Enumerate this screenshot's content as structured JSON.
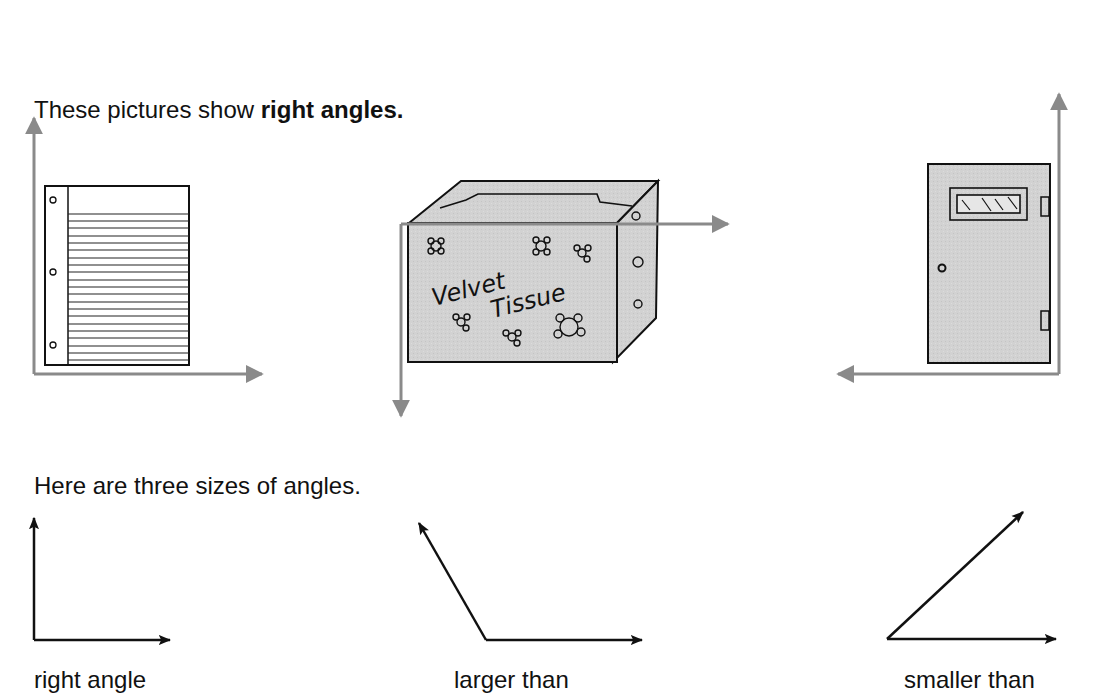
{
  "section1": {
    "intro": "These pictures show ",
    "intro_bold": "right angles.",
    "pictures": [
      {
        "name": "notebook-paper",
        "arrow_directions": [
          "up",
          "right"
        ]
      },
      {
        "name": "tissue-box",
        "label_line1": "Velvet",
        "label_line2": "Tissue",
        "arrow_directions": [
          "right",
          "down"
        ]
      },
      {
        "name": "door",
        "arrow_directions": [
          "up",
          "left"
        ]
      }
    ]
  },
  "section2": {
    "intro": "Here are three sizes of angles.",
    "angles": [
      {
        "label": "right angle",
        "degrees": 90
      },
      {
        "label": "larger than",
        "degrees": 120
      },
      {
        "label": "smaller than",
        "degrees": 40
      }
    ]
  },
  "colors": {
    "arrow_gray": "#8a8a8a",
    "fill_gray": "#cfcfcf",
    "ink": "#111111"
  }
}
